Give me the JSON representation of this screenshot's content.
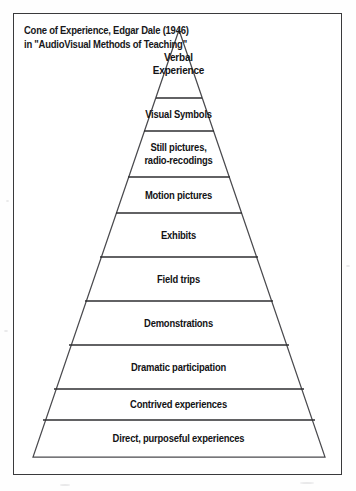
{
  "figure": {
    "caption_lines": [
      "Cone of Experience, Edgar Dale (1946)",
      "in \"AudioVisual Methods of Teaching\""
    ],
    "colors": {
      "frame_border": "#3a3a3c",
      "cone_outline": "#4a4a4e",
      "divider_line": "#2e2e31",
      "text": "#131315",
      "background": "#ffffff"
    }
  },
  "chart_data": {
    "type": "pyramid",
    "title": "Cone of Experience, Edgar Dale (1946)",
    "subtitle": "in \"AudioVisual Methods of Teaching\"",
    "orientation": "apex-up",
    "note": "Abstract experiences at apex, concrete experiences at base",
    "levels": [
      {
        "index": 1,
        "label": "Verbal Experience",
        "lines": [
          "Verbal",
          "Experience"
        ],
        "top_y": 16,
        "bottom_y": 84,
        "half_width_top": 0,
        "half_width_bottom": 23
      },
      {
        "index": 2,
        "label": "Visual Symbols",
        "lines": [
          "Visual Symbols"
        ],
        "top_y": 84,
        "bottom_y": 117,
        "half_width_top": 23,
        "half_width_bottom": 35
      },
      {
        "index": 3,
        "label": "Still pictures, radio-recodings",
        "lines": [
          "Still pictures,",
          "radio-recodings"
        ],
        "top_y": 117,
        "bottom_y": 163,
        "half_width_top": 35,
        "half_width_bottom": 51
      },
      {
        "index": 4,
        "label": "Motion pictures",
        "lines": [
          "Motion pictures"
        ],
        "top_y": 163,
        "bottom_y": 199,
        "half_width_top": 51,
        "half_width_bottom": 63
      },
      {
        "index": 5,
        "label": "Exhibits",
        "lines": [
          "Exhibits"
        ],
        "top_y": 199,
        "bottom_y": 243,
        "half_width_top": 63,
        "half_width_bottom": 79
      },
      {
        "index": 6,
        "label": "Field trips",
        "lines": [
          "Field trips"
        ],
        "top_y": 243,
        "bottom_y": 287,
        "half_width_top": 79,
        "half_width_bottom": 94
      },
      {
        "index": 7,
        "label": "Demonstrations",
        "lines": [
          "Demonstrations"
        ],
        "top_y": 287,
        "bottom_y": 331,
        "half_width_top": 94,
        "half_width_bottom": 110
      },
      {
        "index": 8,
        "label": "Dramatic participation",
        "lines": [
          "Dramatic participation"
        ],
        "top_y": 331,
        "bottom_y": 375,
        "half_width_top": 110,
        "half_width_bottom": 125
      },
      {
        "index": 9,
        "label": "Contrived experiences",
        "lines": [
          "Contrived experiences"
        ],
        "top_y": 375,
        "bottom_y": 406,
        "half_width_top": 125,
        "half_width_bottom": 136
      },
      {
        "index": 10,
        "label": "Direct, purposeful experiences",
        "lines": [
          "Direct, purposeful experiences"
        ],
        "top_y": 406,
        "bottom_y": 443,
        "half_width_top": 136,
        "half_width_bottom": 146
      }
    ],
    "apex": {
      "x": 165,
      "y": 16
    },
    "base": {
      "left_x": 19,
      "right_x": 311,
      "y": 443
    }
  }
}
